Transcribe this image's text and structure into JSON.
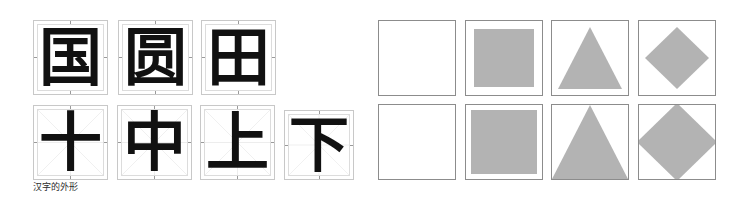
{
  "figure": {
    "caption": "汉字的外形",
    "colors": {
      "shape_fill": "#b3b3b3",
      "cell_border": "#c8c8c8",
      "shape_border": "#8c8c8c",
      "guide_line": "#e2e2e2",
      "glyph": "#111111",
      "background": "#ffffff"
    }
  },
  "character_panel": {
    "rows": [
      {
        "name": "enclosing-shape-row",
        "guides": "ticks-only",
        "cells": [
          {
            "character": "国",
            "x": 33,
            "y": 20,
            "size": 75,
            "font_size": 63
          },
          {
            "character": "圆",
            "x": 118,
            "y": 20,
            "size": 75,
            "font_size": 63
          },
          {
            "character": "田",
            "x": 201,
            "y": 20,
            "size": 75,
            "font_size": 63
          }
        ]
      },
      {
        "name": "cross-shape-row",
        "guides": "mi-zi-ge",
        "cells": [
          {
            "character": "十",
            "x": 33,
            "y": 105,
            "size": 75,
            "font_size": 63
          },
          {
            "character": "中",
            "x": 117,
            "y": 105,
            "size": 75,
            "font_size": 63
          },
          {
            "character": "上",
            "x": 200,
            "y": 105,
            "size": 75,
            "font_size": 63
          },
          {
            "character": "下",
            "x": 284,
            "y": 110,
            "size": 70,
            "font_size": 60
          }
        ]
      }
    ]
  },
  "shape_panel": {
    "rows": [
      {
        "name": "inset-shapes-row",
        "fit": "inset",
        "cells": [
          {
            "shape": "empty-square",
            "x": 12,
            "y": 20,
            "width": 78,
            "height": 76,
            "inset": 0
          },
          {
            "shape": "filled-square",
            "x": 99,
            "y": 20,
            "width": 78,
            "height": 76,
            "inset": 8
          },
          {
            "shape": "triangle",
            "x": 185,
            "y": 20,
            "width": 78,
            "height": 76,
            "inset": 6
          },
          {
            "shape": "diamond",
            "x": 272,
            "y": 20,
            "width": 78,
            "height": 76,
            "inset": 6
          }
        ]
      },
      {
        "name": "full-bleed-shapes-row",
        "fit": "full-bleed",
        "cells": [
          {
            "shape": "empty-square",
            "x": 12,
            "y": 104,
            "width": 78,
            "height": 76,
            "inset": 0
          },
          {
            "shape": "filled-square",
            "x": 99,
            "y": 104,
            "width": 78,
            "height": 76,
            "inset": 5
          },
          {
            "shape": "triangle",
            "x": 185,
            "y": 104,
            "width": 78,
            "height": 76,
            "inset": 0
          },
          {
            "shape": "diamond",
            "x": 272,
            "y": 104,
            "width": 78,
            "height": 76,
            "inset": -2
          }
        ]
      }
    ]
  }
}
